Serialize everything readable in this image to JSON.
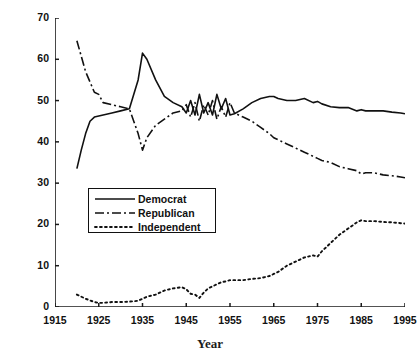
{
  "chart_data": {
    "type": "line",
    "title": "",
    "xlabel": "Year",
    "ylabel": "Percent of Enrollment",
    "xlim": [
      1915,
      1995
    ],
    "ylim": [
      0,
      70
    ],
    "xticks": [
      1915,
      1925,
      1935,
      1945,
      1955,
      1965,
      1975,
      1985,
      1995
    ],
    "yticks": [
      0,
      10,
      20,
      30,
      40,
      50,
      60,
      70
    ],
    "grid": false,
    "legend_position": "center-left",
    "series": [
      {
        "name": "Democrat",
        "style": "solid",
        "color": "#111111",
        "x": [
          1920,
          1921,
          1922,
          1923,
          1924,
          1926,
          1928,
          1930,
          1932,
          1934,
          1935,
          1936,
          1938,
          1940,
          1942,
          1944,
          1945,
          1946,
          1947,
          1948,
          1949,
          1950,
          1951,
          1952,
          1953,
          1954,
          1955,
          1956,
          1958,
          1960,
          1962,
          1964,
          1965,
          1966,
          1968,
          1970,
          1972,
          1974,
          1975,
          1976,
          1978,
          1980,
          1982,
          1984,
          1985,
          1986,
          1988,
          1990,
          1992,
          1994,
          1995
        ],
        "y": [
          33.5,
          38,
          42,
          45,
          46,
          46.5,
          47,
          47.5,
          48,
          55,
          61.5,
          60,
          55,
          51,
          49.5,
          48.5,
          47,
          50,
          46.5,
          51.5,
          47,
          49.5,
          46.5,
          51.5,
          48,
          50.5,
          46.5,
          46.8,
          48,
          49.5,
          50.5,
          51,
          51,
          50.5,
          50,
          50,
          50.5,
          49.5,
          49.8,
          49.2,
          48.5,
          48.3,
          48.3,
          47.5,
          47.8,
          47.5,
          47.5,
          47.5,
          47.2,
          47,
          46.8
        ]
      },
      {
        "name": "Republican",
        "style": "dashdot",
        "color": "#111111",
        "x": [
          1920,
          1922,
          1924,
          1925,
          1926,
          1928,
          1930,
          1932,
          1934,
          1935,
          1936,
          1938,
          1940,
          1942,
          1944,
          1945,
          1946,
          1947,
          1948,
          1949,
          1950,
          1951,
          1952,
          1953,
          1954,
          1955,
          1956,
          1958,
          1960,
          1962,
          1964,
          1965,
          1966,
          1968,
          1970,
          1972,
          1974,
          1975,
          1976,
          1978,
          1980,
          1982,
          1984,
          1985,
          1986,
          1988,
          1990,
          1992,
          1994,
          1995
        ],
        "y": [
          64.5,
          57,
          52,
          51.5,
          49.5,
          49,
          48.5,
          48,
          42,
          38,
          41,
          44,
          45.5,
          47,
          47.5,
          49,
          46,
          49.5,
          45,
          49,
          46.5,
          50,
          45.5,
          48.5,
          46,
          49.5,
          47,
          46,
          45,
          43.5,
          42,
          41,
          40.5,
          39.5,
          38.5,
          37.5,
          36.5,
          36,
          35.5,
          35,
          34,
          33.5,
          33,
          32.2,
          32.5,
          32.5,
          32,
          31.8,
          31.5,
          31.3
        ]
      },
      {
        "name": "Independent",
        "style": "dotted",
        "color": "#111111",
        "x": [
          1920,
          1922,
          1924,
          1925,
          1926,
          1928,
          1930,
          1932,
          1934,
          1935,
          1936,
          1938,
          1940,
          1942,
          1944,
          1945,
          1946,
          1947,
          1948,
          1949,
          1950,
          1951,
          1952,
          1953,
          1954,
          1955,
          1956,
          1958,
          1960,
          1962,
          1964,
          1965,
          1966,
          1968,
          1970,
          1972,
          1974,
          1975,
          1976,
          1978,
          1980,
          1982,
          1984,
          1985,
          1986,
          1988,
          1990,
          1992,
          1994,
          1995
        ],
        "y": [
          3,
          2,
          1.2,
          1,
          1,
          1.2,
          1.2,
          1.3,
          1.5,
          2,
          2.5,
          3,
          4,
          4.5,
          4.8,
          4.3,
          3.2,
          3,
          2.2,
          3.5,
          4.5,
          5,
          5.5,
          6,
          6.2,
          6.5,
          6.5,
          6.5,
          6.8,
          7,
          7.5,
          8,
          8.5,
          10,
          11,
          12,
          12.5,
          12.2,
          13.5,
          15.5,
          17.5,
          19,
          20.5,
          21,
          20.8,
          20.8,
          20.6,
          20.5,
          20.3,
          20.2
        ]
      }
    ]
  },
  "axes": {
    "y_tick_labels": [
      "70",
      "60",
      "50",
      "40",
      "30",
      "20",
      "10",
      "0"
    ],
    "x_tick_labels": [
      "1915",
      "1925",
      "1935",
      "1945",
      "1955",
      "1965",
      "1975",
      "1985",
      "1995"
    ],
    "y_axis_title": "Percent of Enrollment",
    "x_axis_title": "Year"
  },
  "legend": {
    "items": [
      {
        "label": "Democrat",
        "style": "solid"
      },
      {
        "label": "Republican",
        "style": "dashdot"
      },
      {
        "label": "Independent",
        "style": "dotted"
      }
    ]
  }
}
